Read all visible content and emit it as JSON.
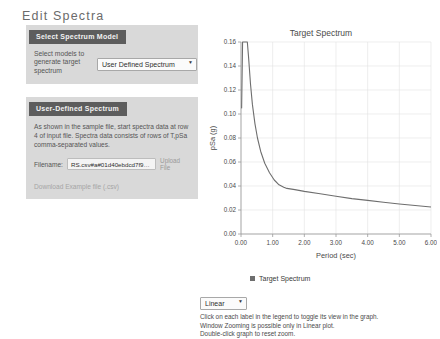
{
  "page": {
    "title": "Edit Spectra"
  },
  "panels": {
    "select_model": {
      "header": "Select Spectrum Model",
      "field_label": "Select models to generate target spectrum",
      "select_value": "User Defined Spectrum",
      "options": [
        "User Defined Spectrum"
      ]
    },
    "user_defined": {
      "header": "User-Defined Spectrum",
      "description": "As shown in the sample file, start spectra data at row 4 of input file. Spectra data consists of rows of T,pSa comma-separated values.",
      "file_label": "Filename:",
      "file_value": "RS.csv#a#01d40ebdcd7f9eb02",
      "upload_link": "Upload File",
      "download_link": "Download Example file (.csv)"
    }
  },
  "chart_data": {
    "type": "line",
    "title": "Target Spectrum",
    "xlabel": "Period (sec)",
    "ylabel": "pSa (g)",
    "xlim": [
      0.0,
      6.0
    ],
    "ylim": [
      0.0,
      0.16
    ],
    "xticks": [
      "0.00",
      "1.00",
      "2.00",
      "3.00",
      "4.00",
      "5.00",
      "6.00"
    ],
    "yticks": [
      "0.00",
      "0.02",
      "0.04",
      "0.06",
      "0.08",
      "0.10",
      "0.12",
      "0.14",
      "0.16"
    ],
    "grid": true,
    "legend_position": "bottom",
    "series": [
      {
        "name": "Target Spectrum",
        "color": "#6e6e6e",
        "x": [
          0.01,
          0.02,
          0.05,
          0.08,
          0.12,
          0.2,
          0.24,
          0.3,
          0.36,
          0.44,
          0.52,
          0.62,
          0.75,
          0.9,
          1.05,
          1.2,
          1.35,
          1.45,
          1.7,
          2.0,
          2.5,
          3.0,
          3.5,
          4.0,
          4.5,
          5.0,
          5.5,
          6.0
        ],
        "y": [
          0.105,
          0.105,
          0.16,
          0.16,
          0.16,
          0.16,
          0.147,
          0.125,
          0.108,
          0.092,
          0.08,
          0.069,
          0.059,
          0.051,
          0.045,
          0.041,
          0.039,
          0.038,
          0.037,
          0.0355,
          0.0335,
          0.0315,
          0.0295,
          0.028,
          0.0265,
          0.025,
          0.0237,
          0.0225
        ]
      }
    ]
  },
  "legend": {
    "label": "Target Spectrum"
  },
  "bottom": {
    "scale_value": "Linear",
    "scale_options": [
      "Linear"
    ],
    "hints": [
      "Click on each label in the legend to toggle its view in the graph.",
      "Window Zooming is possible only in Linear plot.",
      "Double-click graph to reset zoom."
    ]
  }
}
